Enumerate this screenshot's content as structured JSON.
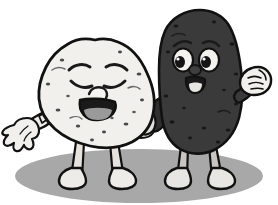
{
  "illustration": {
    "title": "Two cartoon potato characters",
    "background_color": "#ffffff",
    "outline_color": "#111111",
    "style": "grayscale cartoon clip-art, thick black outlines",
    "ground_shadow": {
      "name": "ground-shadow",
      "color": "#a8a8a8",
      "center_x": 139,
      "center_y": 176,
      "radius_x": 124,
      "radius_y": 27
    },
    "characters": [
      {
        "id": "light-potato",
        "label": "Light potato character",
        "position": "left",
        "body_color": "#f2f0ed",
        "body_shade_color": "#dedbd6",
        "speckle_color": "#4a4a4a",
        "limb_color": "#e6e3df",
        "mouth_color": "#1a1a1a",
        "tongue_color": "#9a9a9a",
        "expression": "laughing with closed squinting eyes",
        "eyes": "closed happy arcs",
        "mouth": "wide open laughing smile",
        "left_arm": "outstretched with open spread-finger hand",
        "right_arm": "hidden behind body",
        "legs": 2,
        "feet": 2
      },
      {
        "id": "dark-potato",
        "label": "Dark potato character",
        "position": "right",
        "body_color": "#3a3a3a",
        "body_shade_color": "#2a2a2a",
        "speckle_color": "#151515",
        "limb_color": "#c9c6c1",
        "eye_white_color": "#f4f2ef",
        "pupil_color": "#141414",
        "mouth_color": "#1a1a1a",
        "tongue_color": "#e8e6e2",
        "glove_color": "#f2f0ec",
        "expression": "smiling with wide open eyes looking left",
        "eyes": "large white ovals with dark pupils",
        "mouth": "open smile with tongue",
        "left_arm": "tucked behind the light potato",
        "right_arm": "raised clenched fist",
        "legs": 2,
        "feet": 2
      }
    ]
  }
}
